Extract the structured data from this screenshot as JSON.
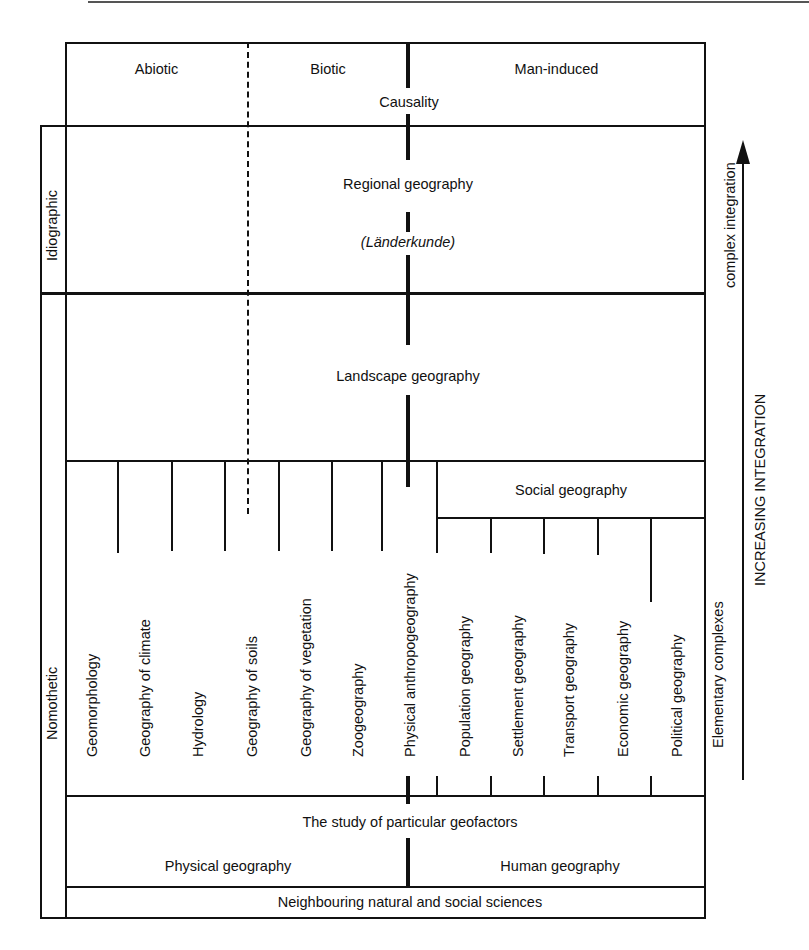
{
  "page": {
    "page_number": "270"
  },
  "header": {
    "categories": [
      "Abiotic",
      "Biotic",
      "Man-induced"
    ],
    "causality": "Causality"
  },
  "left_axis": {
    "idiographic": "Idiographic",
    "nomothetic": "Nomothetic"
  },
  "levels": {
    "regional": {
      "title": "Regional geography",
      "subtitle": "(Länderkunde)"
    },
    "landscape": {
      "title": "Landscape geography"
    },
    "social": {
      "title": "Social geography"
    },
    "particular": {
      "title": "The study of particular geofactors"
    },
    "physical": {
      "title": "Physical geography"
    },
    "human": {
      "title": "Human geography"
    },
    "neighbouring": {
      "title": "Neighbouring natural and social sciences"
    }
  },
  "subdisciplines": [
    "Geomorphology",
    "Geography of climate",
    "Hydrology",
    "Geography of soils",
    "Geography of vegetation",
    "Zoogeography",
    "Physical anthropogeography",
    "Population geography",
    "Settlement geography",
    "Transport geography",
    "Economic geography",
    "Political geography"
  ],
  "right_axis": {
    "elementary": "Elementary complexes",
    "complex": "complex integration",
    "increasing": "INCREASING INTEGRATION",
    "arrow_icon": "arrow-up-icon"
  }
}
